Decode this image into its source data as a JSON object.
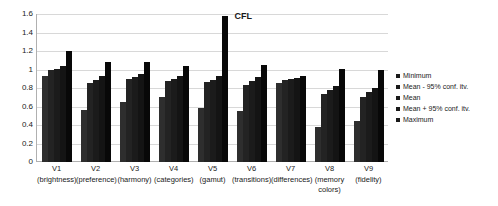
{
  "chart_data": {
    "type": "bar",
    "title": "CFL",
    "xlabel": "",
    "ylabel": "",
    "ylim": [
      0,
      1.6
    ],
    "yticks": [
      0,
      0.2,
      0.4,
      0.6,
      0.8,
      1,
      1.2,
      1.4,
      1.6
    ],
    "ytick_labels": [
      "0",
      "0.2",
      "0.4",
      "0.6",
      "0.8",
      "1",
      "1.2",
      "1.4",
      "1.6"
    ],
    "grid": true,
    "legend_position": "right",
    "categories": [
      "V1",
      "V2",
      "V3",
      "V4",
      "V5",
      "V6",
      "V7",
      "V8",
      "V9"
    ],
    "category_sublabels": [
      "(brightness)",
      "(preference)",
      "(harmony)",
      "(categories)",
      "(gamut)",
      "(transitions)",
      "(differences)",
      "(memory colors)",
      "(fidelity)"
    ],
    "series": [
      {
        "name": "Minimum",
        "values": [
          0.93,
          0.56,
          0.65,
          0.7,
          0.58,
          0.55,
          0.85,
          0.38,
          0.44
        ]
      },
      {
        "name": "Mean - 95% conf. itv.",
        "values": [
          0.99,
          0.85,
          0.9,
          0.88,
          0.86,
          0.83,
          0.89,
          0.73,
          0.7
        ]
      },
      {
        "name": "Mean",
        "values": [
          1.01,
          0.89,
          0.92,
          0.9,
          0.89,
          0.88,
          0.9,
          0.78,
          0.76
        ]
      },
      {
        "name": "Mean + 95% conf. itv.",
        "values": [
          1.04,
          0.93,
          0.95,
          0.93,
          0.93,
          0.92,
          0.91,
          0.82,
          0.8
        ]
      },
      {
        "name": "Maximum",
        "values": [
          1.2,
          1.08,
          1.08,
          1.04,
          1.58,
          1.05,
          0.93,
          1.01,
          1.0
        ]
      }
    ]
  }
}
